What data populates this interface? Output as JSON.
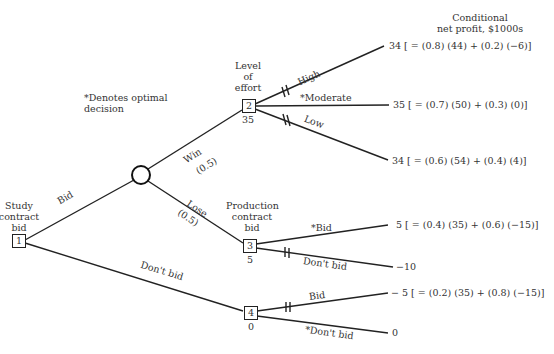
{
  "header": {
    "payoff_title_line1": "Conditional",
    "payoff_title_line2": "net profit, $1000s",
    "legend": "*Denotes optimal decision",
    "legend_line1": "*Denotes optimal",
    "legend_line2": "decision"
  },
  "nodes": {
    "n1": {
      "id": "1",
      "label_lines": [
        "Study",
        "contract",
        "bid"
      ],
      "type": "decision"
    },
    "chance": {
      "type": "chance"
    },
    "n2": {
      "id": "2",
      "value": "35",
      "label_lines": [
        "Level",
        "of",
        "effort"
      ],
      "type": "decision"
    },
    "n3": {
      "id": "3",
      "value": "5",
      "label_lines": [
        "Production",
        "contract",
        "bid"
      ],
      "type": "decision"
    },
    "n4": {
      "id": "4",
      "value": "0",
      "type": "decision"
    }
  },
  "branches": {
    "bid": "Bid",
    "dont_bid": "Don't bid",
    "win": "Win",
    "win_prob": "(0.5)",
    "lose": "Lose",
    "lose_prob": "(0.5)",
    "high": "High",
    "moderate": "*Moderate",
    "low": "Low",
    "n3_bid": "*Bid",
    "n3_dont_bid": "Don't bid",
    "n4_bid": "Bid",
    "n4_dont_bid": "*Don't bid"
  },
  "payoffs": {
    "high": "34 [ = (0.8) (44) + (0.2) (−6)]",
    "moderate": "35 [ = (0.7) (50) + (0.3) (0)]",
    "low": "34 [ = (0.6) (54) + (0.4) (4)]",
    "n3_bid": "5 [ = (0.4) (35) + (0.6) (−15)]",
    "n3_dont_bid": "−10",
    "n4_bid": "− 5 [ = (0.2) (35) + (0.8) (−15)]",
    "n4_dont_bid": "0"
  },
  "colors": {
    "line": "#222222",
    "text": "#333333",
    "background": "#ffffff"
  }
}
